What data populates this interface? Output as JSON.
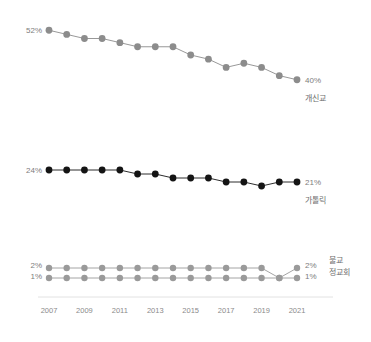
{
  "chart_data": {
    "type": "line",
    "title": "",
    "subtitle": "",
    "xlabel": "",
    "ylabel": "",
    "grid": false,
    "legend_position": "right-inline",
    "x": [
      2007,
      2008,
      2009,
      2010,
      2011,
      2012,
      2013,
      2014,
      2015,
      2016,
      2017,
      2018,
      2019,
      2020,
      2021
    ],
    "tick_labels": [
      "2007",
      "2009",
      "2011",
      "2013",
      "2015",
      "2017",
      "2019",
      "2021"
    ],
    "tick_values": [
      2007,
      2009,
      2011,
      2013,
      2015,
      2017,
      2019,
      2021
    ],
    "panels": [
      {
        "name": "protestant",
        "label": "개신교",
        "color": "#8c8c8c",
        "start_label": "52%",
        "end_label": "40%",
        "ylim": [
          38,
          54
        ],
        "values": [
          52,
          51,
          50,
          50,
          49,
          48,
          48,
          48,
          46,
          45,
          43,
          44,
          43,
          41,
          40
        ]
      },
      {
        "name": "catholic",
        "label": "가톨릭",
        "color": "#141414",
        "start_label": "24%",
        "end_label": "21%",
        "ylim": [
          19,
          26
        ],
        "values": [
          24,
          24,
          24,
          24,
          24,
          23,
          23,
          22,
          22,
          22,
          21,
          21,
          20,
          21,
          21
        ]
      },
      {
        "name": "buddhism-orthodox",
        "label_top": "불교",
        "label_bottom": "정교회",
        "color": "#9a9a9a",
        "start_label_top": "2%",
        "start_label_bottom": "1%",
        "end_label_top": "2%",
        "end_label_bottom": "1%",
        "ylim": [
          0,
          3
        ],
        "series": [
          {
            "name": "불교",
            "values": [
              2,
              2,
              2,
              2,
              2,
              2,
              2,
              2,
              2,
              2,
              2,
              2,
              2,
              1,
              2
            ]
          },
          {
            "name": "정교회",
            "values": [
              1,
              1,
              1,
              1,
              1,
              1,
              1,
              1,
              1,
              1,
              1,
              1,
              1,
              1,
              1
            ]
          }
        ]
      }
    ]
  },
  "axis": {
    "years": [
      "2007",
      "2009",
      "2011",
      "2013",
      "2015",
      "2017",
      "2019",
      "2021"
    ]
  },
  "labels": {
    "protestant_start": "52%",
    "protestant_end": "40%",
    "protestant_name": "개신교",
    "catholic_start": "24%",
    "catholic_end": "21%",
    "catholic_name": "가톨릭",
    "buddhism_start": "2%",
    "buddhism_end": "2%",
    "buddhism_name": "불교",
    "orthodox_start": "1%",
    "orthodox_end": "1%",
    "orthodox_name": "정교회"
  },
  "colors": {
    "protestant": "#8c8c8c",
    "catholic": "#141414",
    "minor": "#9a9a9a",
    "axis_text": "#8a8a8a",
    "background": "#ffffff"
  }
}
